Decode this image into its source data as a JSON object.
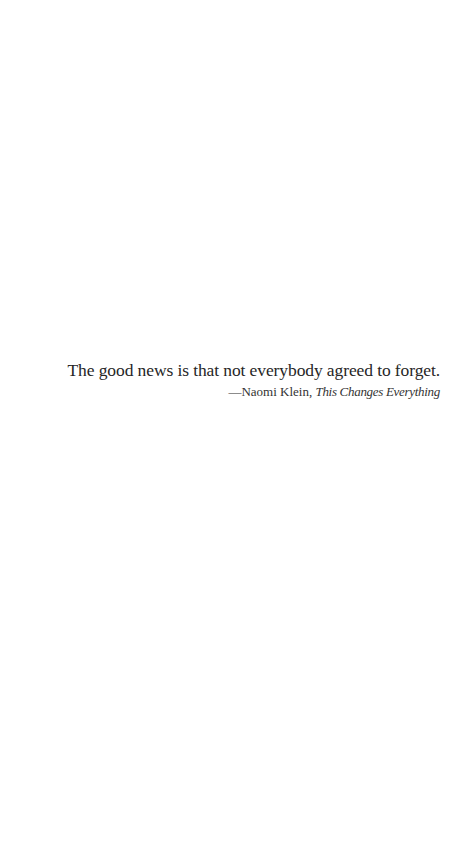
{
  "epigraph": {
    "quote": "The good news is that not everybody agreed to forget.",
    "attribution": {
      "dash": "—",
      "author": "Naomi Klein",
      "separator": ", ",
      "book_title": "This Changes Everything"
    }
  },
  "colors": {
    "background": "#ffffff",
    "text": "#262626"
  }
}
